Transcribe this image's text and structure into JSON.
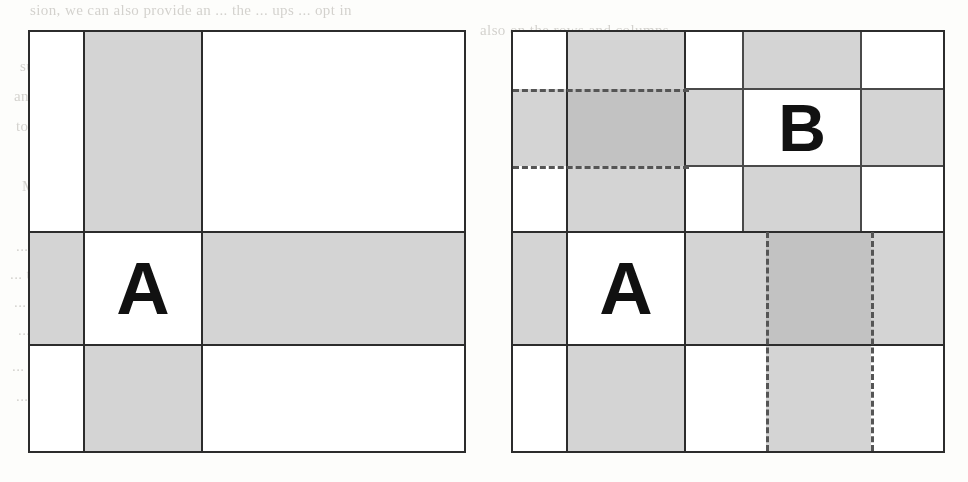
{
  "page": {
    "kind": "scanned-book-page-figure",
    "figure_count": 2,
    "background_text_lines": [
      "sion, we can also provide an ... the ... ups ... opt in",
      "also on the rows and columns.",
      "such requests include: providing a ... on the ... in the meeting",
      "and better search ... on ... any outcomes ... don't",
      "to use ... we discussed it ... undo or ... using the ... used for inter",
      "M we go from the ... to the ... the matrix ... in the ... column",
      "... it ... the grouping ... by ... using a ... to perform a",
      "... to everyone ... the ... the ... in this section, that this ... is can",
      "... reduce ... and ... to ... may ... defined using either the case that",
      "... ... at all the ... to ... and ... up ... second ... and the",
      "... to ... to ... will this ... is ... same ... there ... one ... selected ... to the",
      "... not set ... and the ... of applicable ... within a ... in the grid"
    ]
  },
  "figures": [
    {
      "id": "figure-left",
      "name": "grid-diagram-left",
      "columns": 3,
      "rows": 3,
      "label": "A",
      "label_row": 2,
      "label_column": 2,
      "description": "3x3 grid with shaded column 2 and shaded row 2; cell A at their intersection is white",
      "shaded_column_index": 2,
      "shaded_row_index": 2,
      "column_widths_px": [
        56,
        118,
        262
      ],
      "row_heights_px": [
        200,
        113,
        108
      ],
      "cells": [
        [
          "white",
          "gray",
          "white"
        ],
        [
          "gray",
          "white",
          "gray"
        ],
        [
          "white",
          "gray",
          "white"
        ]
      ]
    },
    {
      "id": "figure-right",
      "name": "grid-diagram-right",
      "columns": 5,
      "rows": 3,
      "labels": [
        "B",
        "A"
      ],
      "label_b_row": 1,
      "label_b_column": 4,
      "label_a_row": 2,
      "label_a_column": 2,
      "description": "5-column grid with two shaded bands and dashed selection guides; cells A and B are white at intersections",
      "column_widths_px": [
        58,
        118,
        58,
        118,
        82
      ],
      "row_heights_px": [
        200,
        113,
        108
      ],
      "top_subrow_heights_px": [
        57,
        77,
        66
      ],
      "dashed_horizontal_y_px": [
        87,
        164
      ],
      "dashed_horizontal_span_x_px": [
        511,
        687
      ],
      "dashed_vertical_x_px": [
        764,
        869
      ],
      "dashed_vertical_span_y_px": [
        232,
        453
      ]
    }
  ],
  "colors": {
    "ink": "#2c2c2c",
    "shade_light": "#d4d4d4",
    "shade_dark": "#c2c2c2",
    "paper": "#fdfdfb",
    "dash": "#555555",
    "bleed_text": "#9a968f"
  },
  "labels": {
    "a": "A",
    "b": "B"
  }
}
